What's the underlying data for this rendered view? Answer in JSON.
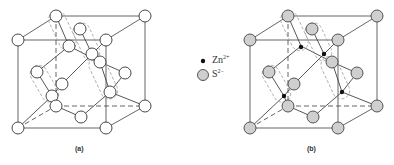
{
  "figure": {
    "panels": [
      {
        "id": "a",
        "label": "(a)",
        "offset_x": 0,
        "shows_zn": false
      },
      {
        "id": "b",
        "label": "(b)",
        "offset_x": 232,
        "shows_zn": true
      }
    ],
    "legend": {
      "items": [
        {
          "symbol": "small-black-dot",
          "ion": "Zn",
          "charge": "2+"
        },
        {
          "symbol": "grey-circle",
          "ion": "S",
          "charge": "2−"
        }
      ]
    },
    "colors": {
      "s_atom_panel_a": "#ffffff",
      "s_atom_panel_b": "#cfcfcf",
      "zn_atom": "#111111",
      "lines": "#555555"
    }
  }
}
